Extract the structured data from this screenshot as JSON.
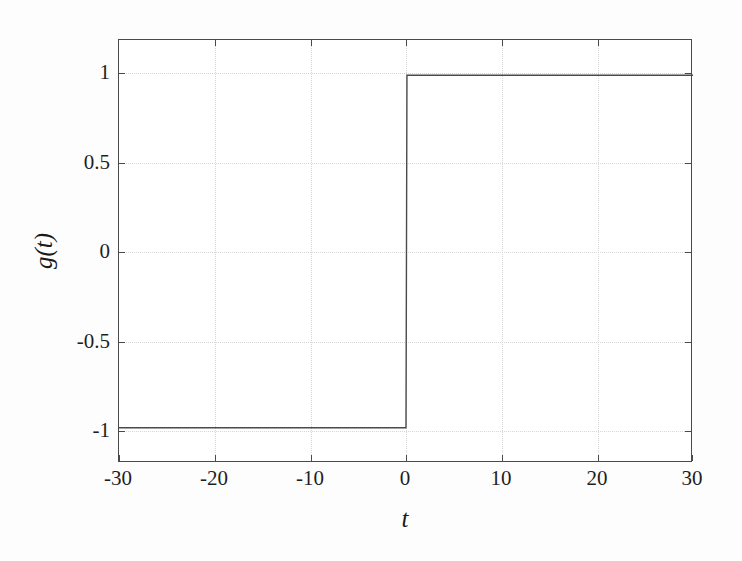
{
  "chart_data": {
    "type": "line",
    "title": "",
    "xlabel": "t",
    "ylabel": "g(t)",
    "xlim": [
      -30,
      30
    ],
    "ylim": [
      -1.2,
      1.2
    ],
    "grid": true,
    "legend": null,
    "xticks": [
      -30,
      -20,
      -10,
      0,
      10,
      20,
      30
    ],
    "xticklabels": [
      "-30",
      "-20",
      "-10",
      "0",
      "10",
      "20",
      "30"
    ],
    "yticks": [
      1,
      0.5,
      0,
      -0.5,
      -1
    ],
    "yticklabels": [
      "1",
      "0.5",
      "0",
      "-0.5",
      "-1"
    ],
    "series": [
      {
        "name": "g(t)",
        "description": "signum step: -1 for t<0, +1 for t>0",
        "x": [
          -30,
          -0.1,
          0,
          0.1,
          30
        ],
        "y": [
          -1,
          -1,
          -1,
          1,
          1
        ]
      }
    ],
    "annotations": []
  },
  "axes": {
    "x_label": "t",
    "y_label": "g(t)",
    "x_tick_labels": [
      "-30",
      "-20",
      "-10",
      "0",
      "10",
      "20",
      "30"
    ],
    "y_tick_labels": [
      "1",
      "0.5",
      "0",
      "-0.5",
      "-1"
    ]
  },
  "colors": {
    "line": "#4a4a4a",
    "grid": "#d6d6d6",
    "frame": "#4a4a4a",
    "text": "#1f1f1f",
    "background": "#fdfdfd",
    "plot_background": "#ffffff"
  }
}
